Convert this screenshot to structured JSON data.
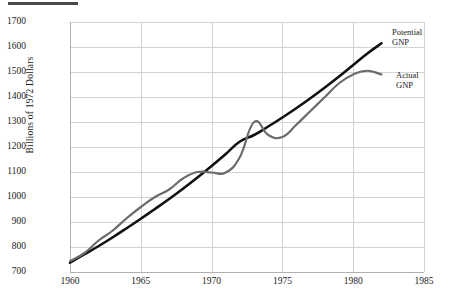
{
  "figure": {
    "top_rule": "rule-mark",
    "ylabel": "Billions of 1972 Dollars"
  },
  "chart_data": {
    "type": "line",
    "title": "",
    "subtitle": "",
    "xlabel": "",
    "ylabel": "Billions of 1972 Dollars",
    "xlim": [
      1960,
      1985
    ],
    "ylim": [
      700,
      1700
    ],
    "xticks": [
      1960,
      1965,
      1970,
      1975,
      1980,
      1985
    ],
    "yticks": [
      700,
      800,
      900,
      1000,
      1100,
      1200,
      1300,
      1400,
      1500,
      1600,
      1700
    ],
    "grid": true,
    "legend_position": "right-inline-annotations",
    "series": [
      {
        "name": "Potential GNP",
        "color": "#111111",
        "width": 2.6,
        "x": [
          1960,
          1961,
          1962,
          1963,
          1964,
          1965,
          1966,
          1967,
          1968,
          1969,
          1970,
          1971,
          1972,
          1973,
          1974,
          1975,
          1976,
          1977,
          1978,
          1979,
          1980,
          1981,
          1982
        ],
        "y": [
          737,
          770,
          803,
          838,
          875,
          913,
          952,
          992,
          1034,
          1078,
          1124,
          1172,
          1222,
          1248,
          1282,
          1318,
          1356,
          1396,
          1438,
          1482,
          1528,
          1574,
          1615
        ]
      },
      {
        "name": "Actual GNP",
        "color": "#6b6b6b",
        "width": 2.2,
        "x": [
          1960,
          1961,
          1962,
          1963,
          1964,
          1965,
          1966,
          1967,
          1968,
          1969,
          1970,
          1971,
          1972,
          1973,
          1974,
          1975,
          1976,
          1977,
          1978,
          1979,
          1980,
          1981,
          1982
        ],
        "y": [
          744,
          775,
          825,
          865,
          915,
          960,
          1000,
          1030,
          1075,
          1100,
          1098,
          1098,
          1160,
          1300,
          1248,
          1240,
          1290,
          1345,
          1400,
          1455,
          1490,
          1505,
          1490
        ]
      }
    ],
    "annotations": [
      {
        "text": "Potential\nGNP",
        "x": 1982,
        "y": 1615,
        "placement": "right"
      },
      {
        "text": "Actual\nGNP",
        "x": 1982,
        "y": 1490,
        "placement": "right"
      }
    ]
  },
  "ytick_labels": [
    "1700",
    "1600",
    "1500",
    "1400",
    "1300",
    "1200",
    "1100",
    "1000",
    "900",
    "800",
    "700"
  ],
  "xtick_labels": [
    "1960",
    "1965",
    "1970",
    "1975",
    "1980",
    "1985"
  ],
  "labels": {
    "potential": "Potential\nGNP",
    "actual": "Actual\nGNP"
  }
}
